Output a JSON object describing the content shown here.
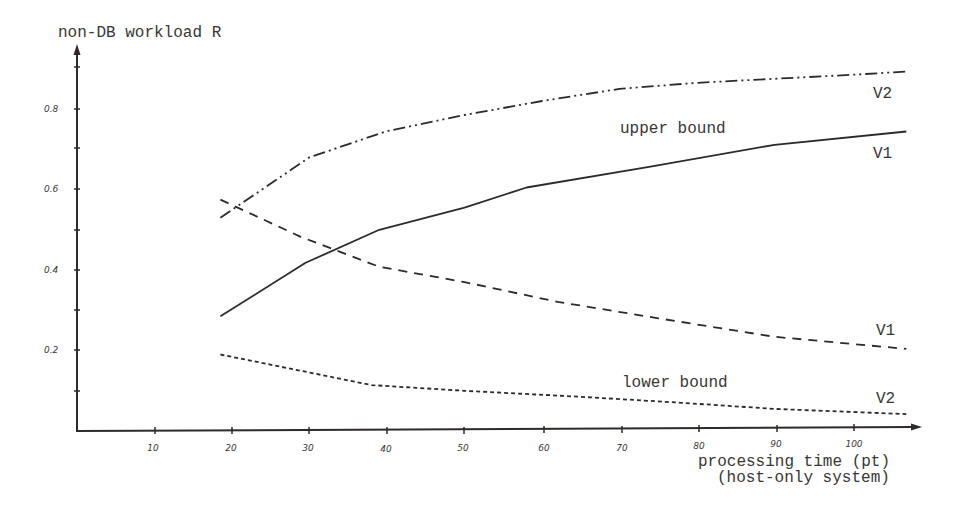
{
  "chart_data": {
    "type": "line",
    "title": "",
    "ylabel": "non-DB workload R",
    "xlabel": "processing time (pt)",
    "xlabel_sub": "(host-only system)",
    "xlim": [
      0,
      110
    ],
    "ylim": [
      0,
      0.95
    ],
    "grid": false,
    "x_ticks": [
      10,
      20,
      30,
      40,
      50,
      60,
      70,
      80,
      90,
      100
    ],
    "x_tick_labels": [
      "10",
      "20",
      "30",
      "40",
      "50",
      "60",
      "70",
      "80",
      "90",
      "100"
    ],
    "y_ticks": [
      0.1,
      0.2,
      0.3,
      0.4,
      0.5,
      0.6,
      0.7,
      0.8,
      0.9
    ],
    "y_tick_labels": [
      "0.2",
      "0.4",
      "0.6",
      "0.8"
    ],
    "y_labeled_ticks": [
      0.2,
      0.4,
      0.6,
      0.8
    ],
    "annotations": [
      "upper bound",
      "lower bound",
      "V2",
      "V1",
      "V1",
      "V2"
    ],
    "series": [
      {
        "name": "upper bound V2",
        "group": "upper bound",
        "label": "V2",
        "style": "dash-dot-dot",
        "x": [
          18.5,
          30,
          40,
          50,
          60,
          70,
          80,
          90,
          100,
          107
        ],
        "y": [
          0.53,
          0.68,
          0.745,
          0.785,
          0.82,
          0.85,
          0.865,
          0.875,
          0.885,
          0.893
        ]
      },
      {
        "name": "upper bound V1",
        "group": "upper bound",
        "label": "V1",
        "style": "solid",
        "x": [
          18.5,
          29.5,
          39,
          50,
          58,
          74,
          90,
          107
        ],
        "y": [
          0.285,
          0.418,
          0.5,
          0.555,
          0.605,
          0.657,
          0.711,
          0.744
        ]
      },
      {
        "name": "lower bound V1",
        "group": "lower bound",
        "label": "V1",
        "style": "dashed",
        "x": [
          18.5,
          28.8,
          39,
          50,
          62,
          75,
          90,
          107
        ],
        "y": [
          0.575,
          0.483,
          0.408,
          0.37,
          0.321,
          0.28,
          0.234,
          0.204
        ]
      },
      {
        "name": "lower bound V2",
        "group": "lower bound",
        "label": "V2",
        "style": "dotted",
        "x": [
          18.5,
          38,
          50,
          65,
          78,
          90,
          107
        ],
        "y": [
          0.19,
          0.114,
          0.1,
          0.085,
          0.07,
          0.055,
          0.042
        ]
      }
    ]
  },
  "labels": {
    "y_axis_title": "non-DB workload R",
    "x_axis_title": "processing time (pt)",
    "x_axis_subtitle": "(host-only system)",
    "upper_bound": "upper bound",
    "lower_bound": "lower bound",
    "upper_v2": "V2",
    "upper_v1": "V1",
    "lower_v1": "V1",
    "lower_v2": "V2",
    "y_ticks": {
      "t02": "0.2",
      "t04": "0.4",
      "t06": "0.6",
      "t08": "0.8"
    },
    "x_ticks": {
      "t10": "10",
      "t20": "20",
      "t30": "30",
      "t40": "40",
      "t50": "50",
      "t60": "60",
      "t70": "70",
      "t80": "80",
      "t90": "90",
      "t100": "100"
    }
  }
}
